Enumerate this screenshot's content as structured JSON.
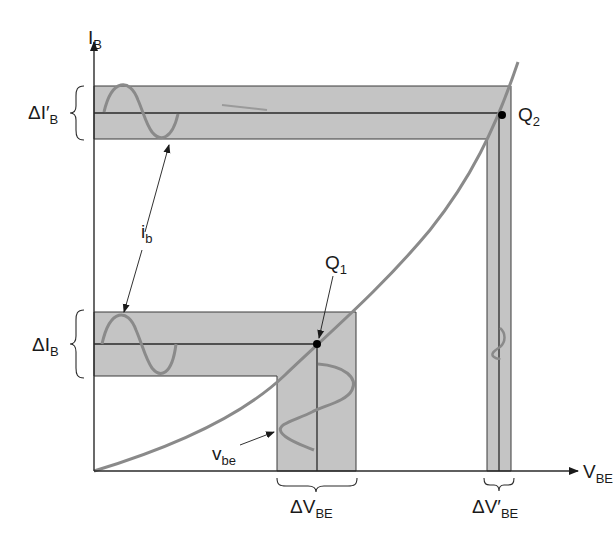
{
  "axes": {
    "y_label": "I",
    "y_label_sub": "B",
    "x_label": "V",
    "x_label_sub": "BE"
  },
  "points": {
    "q1": {
      "label": "Q",
      "sub": "1"
    },
    "q2": {
      "label": "Q",
      "sub": "2"
    }
  },
  "annotations": {
    "delta_ib_prime": {
      "main": "ΔI′",
      "sub": "B"
    },
    "delta_ib": {
      "main": "ΔI",
      "sub": "B"
    },
    "ib_signal": {
      "main": "i",
      "sub": "b"
    },
    "vbe_signal": {
      "main": "v",
      "sub": "be"
    },
    "delta_vbe": {
      "main": "ΔV",
      "sub": "BE"
    },
    "delta_vbe_prime": {
      "main": "ΔV′",
      "sub": "BE"
    }
  },
  "colors": {
    "band_fill": "#c4c4c4",
    "curve": "#8a8a8a",
    "line": "#2a2a2a"
  }
}
